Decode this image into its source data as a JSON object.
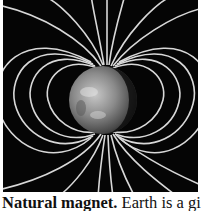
{
  "figure": {
    "colors": {
      "background": "#050505",
      "field_line": "#d8d8d8"
    }
  },
  "caption": {
    "title": "Natural magnet.",
    "text": " Earth is a giant"
  }
}
